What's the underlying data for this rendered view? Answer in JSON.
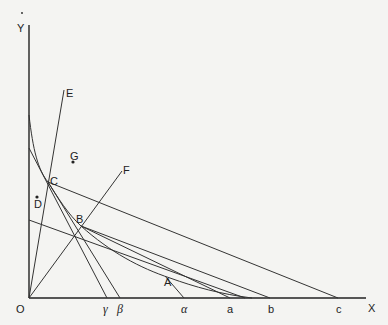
{
  "figure": {
    "axes": {
      "x_label": "X",
      "y_label": "Y",
      "origin_label": "O"
    },
    "points": [
      {
        "id": "A",
        "label": "A"
      },
      {
        "id": "B",
        "label": "B"
      },
      {
        "id": "C",
        "label": "C"
      },
      {
        "id": "D",
        "label": "D"
      },
      {
        "id": "E",
        "label": "E"
      },
      {
        "id": "F",
        "label": "F"
      },
      {
        "id": "G",
        "label": "G"
      }
    ],
    "x_axis_marks": [
      {
        "id": "gamma",
        "label": "γ"
      },
      {
        "id": "beta",
        "label": "β"
      },
      {
        "id": "alpha",
        "label": "α"
      },
      {
        "id": "a",
        "label": "a"
      },
      {
        "id": "b",
        "label": "b"
      },
      {
        "id": "c",
        "label": "c"
      }
    ]
  }
}
